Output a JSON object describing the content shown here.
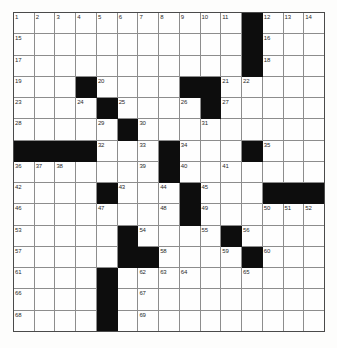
{
  "puzzle": {
    "type": "crossword-grid",
    "columns": 15,
    "rows": 15,
    "block_color": "#0d0d0d",
    "cell_color": "#fefefe",
    "grid_line_color": "#8d8d8d",
    "number_color": "#2a2a2a",
    "cells": [
      [
        {
          "n": "1"
        },
        {
          "n": "2"
        },
        {
          "n": "3"
        },
        {
          "n": "4"
        },
        {
          "n": "5"
        },
        {
          "n": "6"
        },
        {
          "n": "7"
        },
        {
          "n": "8"
        },
        {
          "n": "9"
        },
        {
          "n": "10"
        },
        {
          "n": "11"
        },
        {
          "b": true
        },
        {
          "n": "12"
        },
        {
          "n": "13"
        },
        {
          "n": "14"
        }
      ],
      [
        {
          "n": "15"
        },
        {},
        {},
        {},
        {},
        {},
        {},
        {},
        {},
        {},
        {},
        {
          "b": true
        },
        {
          "n": "16"
        },
        {},
        {}
      ],
      [
        {
          "n": "17"
        },
        {},
        {},
        {},
        {},
        {},
        {},
        {},
        {},
        {},
        {},
        {
          "b": true
        },
        {
          "n": "18"
        },
        {},
        {}
      ],
      [
        {
          "n": "19"
        },
        {},
        {},
        {
          "b": true
        },
        {
          "n": "20"
        },
        {},
        {},
        {},
        {
          "b": true
        },
        {
          "b": true
        },
        {
          "n": "21"
        },
        {
          "n": "22"
        },
        {},
        {},
        {}
      ],
      [
        {
          "n": "23"
        },
        {},
        {},
        {
          "n": "24"
        },
        {
          "b": true
        },
        {
          "n": "25"
        },
        {},
        {},
        {
          "n": "26"
        },
        {
          "b": true
        },
        {
          "n": "27"
        },
        {},
        {},
        {},
        {}
      ],
      [
        {
          "n": "28"
        },
        {},
        {},
        {},
        {
          "n": "29"
        },
        {
          "b": true
        },
        {
          "n": "30"
        },
        {},
        {},
        {
          "n": "31"
        },
        {},
        {},
        {},
        {},
        {}
      ],
      [
        {
          "b": true
        },
        {
          "b": true
        },
        {
          "b": true
        },
        {
          "b": true
        },
        {
          "n": "32"
        },
        {},
        {
          "n": "33"
        },
        {
          "b": true
        },
        {
          "n": "34"
        },
        {},
        {},
        {
          "b": true
        },
        {
          "n": "35"
        },
        {},
        {}
      ],
      [
        {
          "n": "36"
        },
        {
          "n": "37"
        },
        {
          "n": "38"
        },
        {},
        {},
        {},
        {
          "n": "39"
        },
        {
          "b": true
        },
        {
          "n": "40"
        },
        {},
        {
          "n": "41"
        },
        {},
        {},
        {},
        {}
      ],
      [
        {
          "n": "42"
        },
        {},
        {},
        {},
        {
          "b": true
        },
        {
          "n": "43"
        },
        {},
        {
          "n": "44"
        },
        {
          "b": true
        },
        {
          "n": "45"
        },
        {},
        {},
        {
          "b": true
        },
        {
          "b": true
        },
        {
          "b": true
        }
      ],
      [
        {
          "n": "46"
        },
        {},
        {},
        {},
        {
          "n": "47"
        },
        {},
        {},
        {
          "n": "48"
        },
        {
          "b": true
        },
        {
          "n": "49"
        },
        {},
        {},
        {
          "n": "50"
        },
        {
          "n": "51"
        },
        {
          "n": "52"
        }
      ],
      [
        {
          "n": "53"
        },
        {},
        {},
        {},
        {},
        {
          "b": true
        },
        {
          "n": "54"
        },
        {},
        {},
        {
          "n": "55"
        },
        {
          "b": true
        },
        {
          "n": "56"
        },
        {},
        {},
        {}
      ],
      [
        {
          "n": "57"
        },
        {},
        {},
        {},
        {},
        {
          "b": true
        },
        {
          "b": true
        },
        {
          "n": "58"
        },
        {},
        {},
        {
          "n": "59"
        },
        {
          "b": true
        },
        {
          "n": "60"
        },
        {},
        {}
      ],
      [
        {
          "n": "61"
        },
        {},
        {},
        {},
        {
          "b": true
        },
        {},
        {
          "n": "62"
        },
        {
          "n": "63"
        },
        {
          "n": "64"
        },
        {},
        {},
        {
          "n": "65"
        },
        {},
        {},
        {}
      ],
      [
        {
          "n": "66"
        },
        {},
        {},
        {},
        {
          "b": true
        },
        {},
        {
          "n": "67"
        },
        {},
        {},
        {},
        {},
        {},
        {},
        {},
        {}
      ],
      [
        {
          "n": "68"
        },
        {},
        {},
        {},
        {
          "b": true
        },
        {},
        {
          "n": "69"
        },
        {},
        {},
        {},
        {},
        {},
        {},
        {},
        {}
      ]
    ]
  }
}
